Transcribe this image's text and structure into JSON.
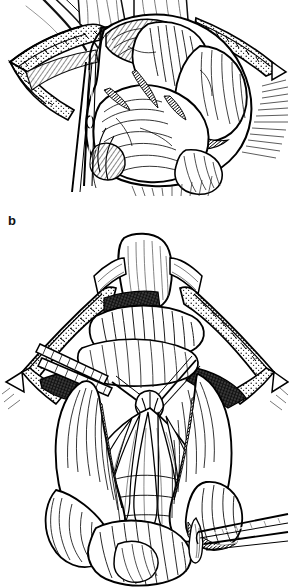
{
  "figure": {
    "kind": "surgical-line-illustration",
    "medium": "pen-and-ink hatching",
    "palette": {
      "ink": "#000000",
      "paper": "#ffffff",
      "mid_gray": "#6e6e6e",
      "light_gray": "#bdbdbd"
    },
    "panel_count": 2,
    "orientation": "vertical-stack"
  },
  "panels": [
    {
      "id": "a",
      "label": "",
      "label_visible": false,
      "title": "Exteriorized small bowel loops through laparotomy wound",
      "description": "Midline abdominal wound held open by draped retractor edges; multiple distended small intestinal loops delivered out of the peritoneal cavity; a long forceps with ring handle enters from the lower left.",
      "crop_note": "top of panel is cut off by the image edge",
      "elements": [
        {
          "name": "wound-edge-left",
          "label": "Retracted wound edge with surgical drape"
        },
        {
          "name": "wound-edge-right",
          "label": "Retracted wound edge with surgical drape"
        },
        {
          "name": "bowel-loop-mass",
          "label": "Exteriorized small bowel loops"
        },
        {
          "name": "mesentery",
          "label": "Mesentery"
        },
        {
          "name": "forceps-instrument",
          "label": "Long ring-handled forceps"
        },
        {
          "name": "skin-surface",
          "label": "Abdominal skin surface"
        }
      ]
    },
    {
      "id": "b",
      "label": "b",
      "label_visible": true,
      "title": "Mesenteric fan displayed with bowel retracted to either side",
      "description": "Diamond-shaped retracted wound; a pale tongue-shaped structure at the top of the field; two flat retractors enter from the upper left; the mesenteric fan with its arcade vessels is spread out centrally while loops of bowel are held to the left and right; a forceps enters from the lower right grasping a small distal structure.",
      "elements": [
        {
          "name": "pale-apex-structure",
          "label": "Pale tongue-shaped structure at apex of field"
        },
        {
          "name": "wound-edge-diamond",
          "label": "Diamond-shaped retracted wound edge with drape"
        },
        {
          "name": "retractor-blade-upper-left",
          "label": "Flat retractor blade"
        },
        {
          "name": "retractor-blade-lower-left",
          "label": "Flat retractor blade"
        },
        {
          "name": "mesenteric-fan",
          "label": "Mesentery with fanned arcade vessels"
        },
        {
          "name": "bowel-loop-left",
          "label": "Small bowel loops held to the left"
        },
        {
          "name": "bowel-loop-right",
          "label": "Small bowel loops held to the right"
        },
        {
          "name": "bowel-loop-inferior",
          "label": "Dependent bowel loops at lower field"
        },
        {
          "name": "forceps-lower-right",
          "label": "Forceps grasping distal structure"
        }
      ]
    }
  ]
}
